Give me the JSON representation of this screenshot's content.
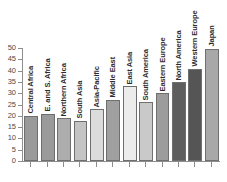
{
  "figure": {
    "top_caption": "",
    "background_color": "#ffffff"
  },
  "chart_data": {
    "type": "bar",
    "title": "",
    "subtitle": "",
    "xlabel": "",
    "ylabel": "",
    "ylim": [
      0,
      50
    ],
    "ytick_step": 5,
    "yticks": [
      0,
      5,
      10,
      15,
      20,
      25,
      30,
      35,
      40,
      45,
      50
    ],
    "ytick_labels": [
      "0",
      "5",
      "10",
      "15",
      "20",
      "25",
      "30",
      "35",
      "40",
      "45",
      "50"
    ],
    "grid": false,
    "legend": null,
    "orientation": "vertical",
    "bar_label_rotation": 90,
    "categories": [
      "Central Africa",
      "E. and S. Africa",
      "Northern Africa",
      "South Asia",
      "Asia-Pacific",
      "Middle East",
      "East Asia",
      "South America",
      "Eastern Europe",
      "North America",
      "Western Europe",
      "Japan"
    ],
    "values": [
      20,
      21,
      19,
      17.8,
      23,
      27,
      33,
      26,
      30,
      34.8,
      40.8,
      49.7
    ],
    "bar_colors": [
      "#9a9a9a",
      "#9a9a9a",
      "#adadad",
      "#c4c4c4",
      "#dcdcdc",
      "#a0a0a0",
      "#ececec",
      "#c9c9c9",
      "#9c9c9c",
      "#5e5e5e",
      "#555555",
      "#a8a8a8"
    ],
    "bar_edge_color": "#6f6f6f",
    "axis_color": "#8d8d8d",
    "tick_label_color": "#4a4a4a",
    "bar_label_color": "#2b2b2b"
  }
}
